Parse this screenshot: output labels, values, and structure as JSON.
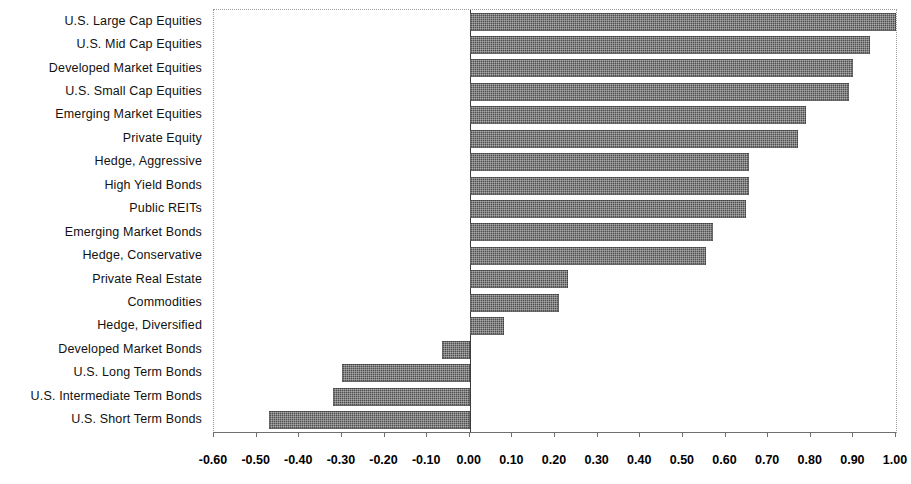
{
  "chart_data": {
    "type": "bar",
    "orientation": "horizontal",
    "title": "",
    "subtitle": "",
    "xlabel": "",
    "ylabel": "",
    "xlim": [
      -0.6,
      1.0
    ],
    "xtick_step": 0.1,
    "grid": false,
    "legend": null,
    "bar_color": "#4e4e4e",
    "bar_pattern": "dithered-checker",
    "categories": [
      "U.S. Large Cap Equities",
      "U.S. Mid Cap Equities",
      "Developed Market Equities",
      "U.S. Small Cap Equities",
      "Emerging Market Equities",
      "Private Equity",
      "Hedge, Aggressive",
      "High Yield Bonds",
      "Public REITs",
      "Emerging Market Bonds",
      "Hedge, Conservative",
      "Private Real Estate",
      "Commodities",
      "Hedge, Diversified",
      "Developed Market Bonds",
      "U.S. Long Term Bonds",
      "U.S. Intermediate Term  Bonds",
      "U.S. Short Term  Bonds"
    ],
    "values": [
      1.0,
      0.94,
      0.9,
      0.89,
      0.79,
      0.77,
      0.655,
      0.655,
      0.648,
      0.57,
      0.555,
      0.23,
      0.21,
      0.08,
      -0.065,
      -0.3,
      -0.32,
      -0.47
    ],
    "xticks": [
      "-0.60",
      "-0.50",
      "-0.40",
      "-0.30",
      "-0.20",
      "-0.10",
      "0.00",
      "0.10",
      "0.20",
      "0.30",
      "0.40",
      "0.50",
      "0.60",
      "0.70",
      "0.80",
      "0.90",
      "1.00"
    ],
    "xtick_values": [
      -0.6,
      -0.5,
      -0.4,
      -0.3,
      -0.2,
      -0.1,
      0.0,
      0.1,
      0.2,
      0.3,
      0.4,
      0.5,
      0.6,
      0.7,
      0.8,
      0.9,
      1.0
    ]
  }
}
